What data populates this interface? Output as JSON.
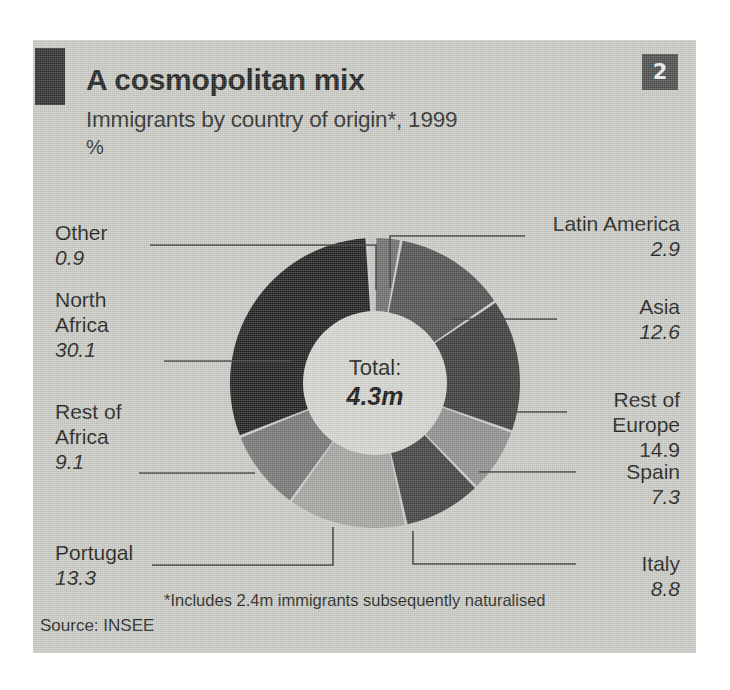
{
  "card": {
    "background_color": "#c9c9c4",
    "badge_label": "2",
    "title": "A cosmopolitan mix",
    "subtitle": "Immigrants by country of origin*, 1999",
    "units": "%",
    "footnote": "*Includes 2.4m immigrants subsequently naturalised",
    "source": "Source: INSEE"
  },
  "center": {
    "total_label": "Total:",
    "total_value": "4.3m"
  },
  "chart_data": {
    "type": "pie",
    "variant": "donut",
    "title": "A cosmopolitan mix",
    "subtitle": "Immigrants by country of origin*, 1999",
    "ylabel": "%",
    "units": "%",
    "total": "4.3m",
    "legend": "callout-labels",
    "grid": false,
    "start_angle_deg": 0,
    "direction": "clockwise",
    "categories": [
      "Latin America",
      "Asia",
      "Rest of Europe",
      "Spain",
      "Italy",
      "Portugal",
      "Rest of Africa",
      "North Africa",
      "Other"
    ],
    "values": [
      2.9,
      12.6,
      14.9,
      7.3,
      8.8,
      13.3,
      9.1,
      30.1,
      0.9
    ],
    "colors": [
      "#6d6d6d",
      "#4f4f4f",
      "#3a3a3a",
      "#8d8d8d",
      "#3f3f3f",
      "#a3a3a0",
      "#757575",
      "#1e1e1e",
      "#c3c3bf"
    ],
    "slices": [
      {
        "label": "Latin America",
        "value": 2.9,
        "color": "#6d6d6d"
      },
      {
        "label": "Asia",
        "value": 12.6,
        "color": "#4f4f4f"
      },
      {
        "label": "Rest of Europe",
        "value": 14.9,
        "color": "#3a3a3a"
      },
      {
        "label": "Spain",
        "value": 7.3,
        "color": "#8d8d8d"
      },
      {
        "label": "Italy",
        "value": 8.8,
        "color": "#3f3f3f"
      },
      {
        "label": "Portugal",
        "value": 13.3,
        "color": "#a3a3a0"
      },
      {
        "label": "Rest of Africa",
        "value": 9.1,
        "color": "#757575"
      },
      {
        "label": "North Africa",
        "value": 30.1,
        "color": "#1e1e1e"
      },
      {
        "label": "Other",
        "value": 0.9,
        "color": "#c3c3bf"
      }
    ]
  },
  "callouts": {
    "other": {
      "name": "Other",
      "value": "0.9"
    },
    "north_africa": {
      "name": "North\nAfrica",
      "value": "30.1"
    },
    "rest_of_africa": {
      "name": "Rest of\nAfrica",
      "value": "9.1"
    },
    "portugal": {
      "name": "Portugal",
      "value": "13.3"
    },
    "latin_america": {
      "name": "Latin America",
      "value": "2.9"
    },
    "asia": {
      "name": "Asia",
      "value": "12.6"
    },
    "rest_of_europe": {
      "name": "Rest of\nEurope",
      "value": "14.9"
    },
    "spain": {
      "name": "Spain",
      "value": "7.3"
    },
    "italy": {
      "name": "Italy",
      "value": "8.8"
    }
  }
}
